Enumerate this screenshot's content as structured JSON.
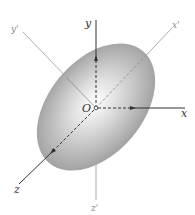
{
  "figure": {
    "type": "3d-axes-ellipsoid",
    "origin_label": "O",
    "axes": [
      {
        "id": "x",
        "label": "x",
        "style": "solid"
      },
      {
        "id": "y",
        "label": "y",
        "style": "solid"
      },
      {
        "id": "z",
        "label": "z",
        "style": "solid"
      },
      {
        "id": "x-prime",
        "label": "x'",
        "style": "thin-gray"
      },
      {
        "id": "y-prime",
        "label": "y'",
        "style": "thin-gray"
      },
      {
        "id": "z-prime",
        "label": "z'",
        "style": "thin-gray"
      }
    ],
    "body": "ellipsoid",
    "colors": {
      "body_light": "#ffffff",
      "body_dark": "#8a8a8a",
      "axis": "#333333",
      "principal_axis": "#9a9a9a"
    }
  }
}
